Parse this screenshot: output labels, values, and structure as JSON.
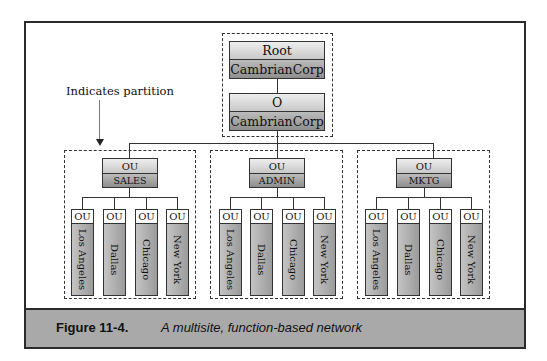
{
  "root_partition": {
    "root": {
      "type": "Root",
      "name": "CambrianCorp"
    },
    "org": {
      "type": "O",
      "name": "CambrianCorp"
    }
  },
  "annotation": {
    "text": "Indicates partition"
  },
  "departments": [
    {
      "type": "OU",
      "name": "SALES",
      "sites": [
        {
          "type": "OU",
          "name": "Los Angeles"
        },
        {
          "type": "OU",
          "name": "Dallas"
        },
        {
          "type": "OU",
          "name": "Chicago"
        },
        {
          "type": "OU",
          "name": "New York"
        }
      ]
    },
    {
      "type": "OU",
      "name": "ADMIN",
      "sites": [
        {
          "type": "OU",
          "name": "Los Angeles"
        },
        {
          "type": "OU",
          "name": "Dallas"
        },
        {
          "type": "OU",
          "name": "Chicago"
        },
        {
          "type": "OU",
          "name": "New York"
        }
      ]
    },
    {
      "type": "OU",
      "name": "MKTG",
      "sites": [
        {
          "type": "OU",
          "name": "Los Angeles"
        },
        {
          "type": "OU",
          "name": "Dallas"
        },
        {
          "type": "OU",
          "name": "Chicago"
        },
        {
          "type": "OU",
          "name": "New York"
        }
      ]
    }
  ],
  "caption": {
    "label": "Figure 11-4.",
    "text": "A multisite, function-based network"
  },
  "colors": {
    "caption_bg": "#a9a9a9",
    "node_dark": "#8e8e8e",
    "node_light": "#eeeeee",
    "border": "#333333"
  }
}
